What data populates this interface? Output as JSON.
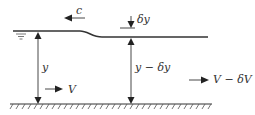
{
  "diagram": {
    "labels": {
      "celerity": "c",
      "depth_drop": "δy",
      "upstream_depth": "y",
      "downstream_depth": "y − δy",
      "upstream_velocity": "V",
      "downstream_velocity": "V − δV"
    },
    "colors": {
      "line": "#333333",
      "background": "#ffffff"
    }
  }
}
